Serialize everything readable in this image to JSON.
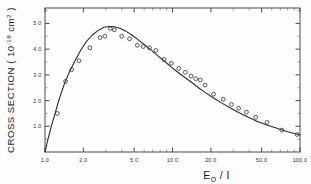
{
  "figure": {
    "name": "ionization-cross-section-plot",
    "background": "#fefefe",
    "curve_color": "#2b2b2b",
    "marker_color": "#3a3a3a",
    "axis_color": "#4a4a4a"
  },
  "chart_data": {
    "type": "scatter",
    "title": "",
    "xlabel_parts": {
      "main": "E",
      "sub": "O",
      "tail": " / I"
    },
    "xlabel": "E_O / I",
    "ylabel": "CROSS SECTION ( 10^-18 cm^2 )",
    "ylabel_parts": {
      "lead": "CROSS SECTION ( 10",
      "sup1": "-18",
      "mid": " cm",
      "sup2": "2",
      "tail": " )"
    },
    "xscale": "log",
    "yscale": "linear",
    "xlim": [
      1.0,
      100.0
    ],
    "ylim": [
      0.0,
      5.6
    ],
    "grid": false,
    "legend": false,
    "xticks": [
      1.0,
      2.0,
      5.0,
      10.0,
      20.0,
      50.0,
      100.0
    ],
    "xticklabels": [
      "1.0",
      "2.0",
      "5.0",
      "10.0",
      "20.0",
      "50.0",
      "100.0"
    ],
    "xminorticks": [
      3.0,
      4.0,
      6.0,
      7.0,
      8.0,
      9.0,
      30.0,
      40.0,
      60.0,
      70.0,
      80.0,
      90.0
    ],
    "yticks": [
      1.0,
      2.0,
      3.0,
      4.0,
      5.0
    ],
    "yticklabels": [
      "1.0",
      "2.0",
      "3.0",
      "4.0",
      "5.0"
    ],
    "yminorticks": [
      0.5,
      1.5,
      2.5,
      3.5,
      4.5,
      5.5
    ],
    "series": [
      {
        "name": "measured cross section",
        "style": "open-circle-markers",
        "x": [
          1.25,
          1.45,
          1.62,
          1.85,
          2.25,
          2.7,
          2.95,
          3.25,
          3.5,
          4.0,
          4.6,
          5.3,
          5.9,
          6.6,
          7.4,
          8.6,
          9.8,
          11.2,
          12.6,
          14.0,
          15.2,
          16.5,
          18.0,
          21.0,
          25.0,
          29.0,
          33.0,
          38.0,
          45.0,
          55.0,
          72.0,
          95.0
        ],
        "y": [
          1.5,
          2.75,
          3.2,
          3.55,
          4.05,
          4.45,
          4.5,
          4.8,
          4.75,
          4.5,
          4.4,
          4.15,
          4.1,
          4.05,
          3.95,
          3.6,
          3.45,
          3.25,
          3.1,
          2.95,
          2.85,
          2.8,
          2.6,
          2.25,
          2.05,
          1.85,
          1.7,
          1.55,
          1.35,
          1.15,
          0.85,
          0.68
        ]
      },
      {
        "name": "theoretical fit curve",
        "style": "solid-line",
        "x": [
          1.0,
          1.05,
          1.12,
          1.2,
          1.3,
          1.42,
          1.55,
          1.7,
          1.9,
          2.1,
          2.35,
          2.6,
          2.9,
          3.2,
          3.5,
          3.9,
          4.3,
          4.8,
          5.4,
          6.0,
          6.8,
          7.6,
          8.6,
          9.8,
          11.0,
          12.5,
          14.0,
          16.0,
          18.0,
          21.0,
          24.0,
          28.0,
          33.0,
          39.0,
          46.0,
          55.0,
          66.0,
          80.0,
          100.0
        ],
        "y": [
          0.0,
          0.45,
          1.0,
          1.5,
          2.1,
          2.65,
          3.1,
          3.5,
          3.95,
          4.28,
          4.55,
          4.72,
          4.85,
          4.88,
          4.87,
          4.8,
          4.7,
          4.55,
          4.36,
          4.18,
          3.96,
          3.76,
          3.54,
          3.3,
          3.1,
          2.9,
          2.72,
          2.5,
          2.32,
          2.1,
          1.92,
          1.73,
          1.54,
          1.36,
          1.2,
          1.05,
          0.92,
          0.79,
          0.66
        ]
      }
    ]
  }
}
